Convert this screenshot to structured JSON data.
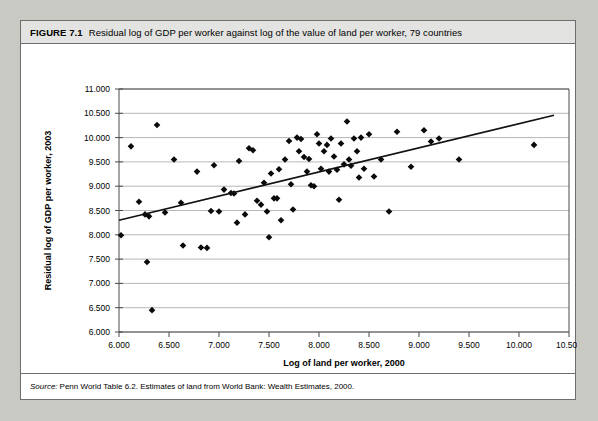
{
  "figure": {
    "number_label": "FIGURE 7.1",
    "title": "Residual log of GDP per worker against log of the value of land per worker, 79 countries",
    "source_label": "Source:",
    "source_text": "Penn World Table 6.2. Estimates of land from World Bank: Wealth Estimates, 2000."
  },
  "chart_data": {
    "type": "scatter",
    "title": "Residual log of GDP per worker against log of the value of land per worker, 79 countries",
    "xlabel": "Log of land per worker, 2000",
    "ylabel": "Residual log of GDP per worker, 2003",
    "xlim": [
      6.0,
      10.5
    ],
    "ylim": [
      6.0,
      11.0
    ],
    "xticks": [
      "6.000",
      "6.500",
      "7.000",
      "7.500",
      "8.000",
      "8.500",
      "9.000",
      "9.500",
      "10.000",
      "10.500"
    ],
    "yticks": [
      "6.000",
      "6.500",
      "7.000",
      "7.500",
      "8.000",
      "8.500",
      "9.000",
      "9.500",
      "10.000",
      "10.500",
      "11.000"
    ],
    "xtick_values": [
      6.0,
      6.5,
      7.0,
      7.5,
      8.0,
      8.5,
      9.0,
      9.5,
      10.0,
      10.5
    ],
    "ytick_values": [
      6.0,
      6.5,
      7.0,
      7.5,
      8.0,
      8.5,
      9.0,
      9.5,
      10.0,
      10.5,
      11.0
    ],
    "grid": "horizontal",
    "legend": "none",
    "n_points": 79,
    "marker_color": "#0a0a0a",
    "line_color": "#111111",
    "trendline": {
      "type": "linear-fit",
      "x_start": 6.0,
      "y_start": 8.3,
      "x_end": 10.35,
      "y_end": 10.46
    },
    "points": [
      [
        6.02,
        7.99
      ],
      [
        6.12,
        9.82
      ],
      [
        6.2,
        8.68
      ],
      [
        6.26,
        8.42
      ],
      [
        6.28,
        7.44
      ],
      [
        6.3,
        8.38
      ],
      [
        6.33,
        6.45
      ],
      [
        6.38,
        10.26
      ],
      [
        6.46,
        8.46
      ],
      [
        6.55,
        9.55
      ],
      [
        6.62,
        8.66
      ],
      [
        6.64,
        7.78
      ],
      [
        6.78,
        9.3
      ],
      [
        6.82,
        7.74
      ],
      [
        6.88,
        7.73
      ],
      [
        6.92,
        8.49
      ],
      [
        6.95,
        9.43
      ],
      [
        7.0,
        8.48
      ],
      [
        7.05,
        8.93
      ],
      [
        7.12,
        8.86
      ],
      [
        7.15,
        8.85
      ],
      [
        7.18,
        8.25
      ],
      [
        7.2,
        9.52
      ],
      [
        7.26,
        8.42
      ],
      [
        7.3,
        9.78
      ],
      [
        7.34,
        9.74
      ],
      [
        7.38,
        8.7
      ],
      [
        7.42,
        8.62
      ],
      [
        7.45,
        9.07
      ],
      [
        7.48,
        8.48
      ],
      [
        7.5,
        7.95
      ],
      [
        7.52,
        9.26
      ],
      [
        7.55,
        8.75
      ],
      [
        7.58,
        8.75
      ],
      [
        7.6,
        9.35
      ],
      [
        7.62,
        8.3
      ],
      [
        7.66,
        9.55
      ],
      [
        7.7,
        9.93
      ],
      [
        7.72,
        9.04
      ],
      [
        7.74,
        8.52
      ],
      [
        7.78,
        10.0
      ],
      [
        7.8,
        9.72
      ],
      [
        7.82,
        9.97
      ],
      [
        7.85,
        9.6
      ],
      [
        7.88,
        9.3
      ],
      [
        7.9,
        9.56
      ],
      [
        7.92,
        9.02
      ],
      [
        7.95,
        9.0
      ],
      [
        7.98,
        10.07
      ],
      [
        8.0,
        9.88
      ],
      [
        8.02,
        9.36
      ],
      [
        8.05,
        9.72
      ],
      [
        8.08,
        9.85
      ],
      [
        8.1,
        9.3
      ],
      [
        8.12,
        9.98
      ],
      [
        8.15,
        9.61
      ],
      [
        8.18,
        9.34
      ],
      [
        8.2,
        8.72
      ],
      [
        8.22,
        9.88
      ],
      [
        8.25,
        9.45
      ],
      [
        8.28,
        10.33
      ],
      [
        8.3,
        9.55
      ],
      [
        8.32,
        9.42
      ],
      [
        8.35,
        9.98
      ],
      [
        8.38,
        9.72
      ],
      [
        8.4,
        9.18
      ],
      [
        8.42,
        10.0
      ],
      [
        8.45,
        9.36
      ],
      [
        8.5,
        10.07
      ],
      [
        8.55,
        9.2
      ],
      [
        8.62,
        9.55
      ],
      [
        8.7,
        8.48
      ],
      [
        8.78,
        10.12
      ],
      [
        8.92,
        9.4
      ],
      [
        9.05,
        10.15
      ],
      [
        9.12,
        9.92
      ],
      [
        9.2,
        9.98
      ],
      [
        9.4,
        9.55
      ],
      [
        10.15,
        9.85
      ]
    ]
  }
}
